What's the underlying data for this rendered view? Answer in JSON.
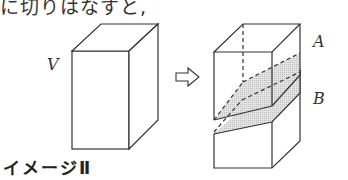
{
  "document": {
    "top_text": "に切りはなすと,",
    "caption": "イメージⅡ"
  },
  "figure": {
    "labels": {
      "original_solid": "V",
      "upper_piece": "A",
      "lower_piece": "B"
    },
    "arrow_icon": "right-outline-arrow-icon",
    "colors": {
      "line": "#333333",
      "cut_plane_fill": "#d8d8d8"
    }
  }
}
